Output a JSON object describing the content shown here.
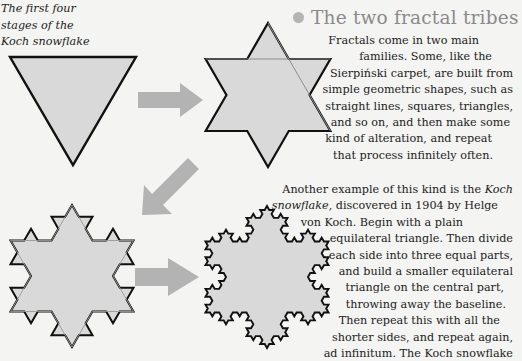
{
  "caption": {
    "lines": [
      "The first four",
      "stages of the",
      "Koch snowflake"
    ]
  },
  "heading": {
    "bullet_icon": "circle-bullet-icon",
    "title": "The two fractal tribes"
  },
  "paragraph1": {
    "lines": [
      "Fractals come in two main",
      "families. Some, like the",
      "Sierpiński carpet, are built from",
      "simple geometric shapes, such as",
      "straight lines, squares, triangles,",
      "and so on, and then make some",
      "kind of alteration, and repeat",
      "that process infinitely often."
    ]
  },
  "paragraph2": {
    "line1_pre": "Another example of this kind is the ",
    "line1_em": "Koch",
    "line2_em": "snowflake",
    "line2_post": ", discovered in 1904 by Helge",
    "lines": [
      "von Koch. Begin with a plain",
      "equilateral triangle. Then divide",
      "each side into three equal parts,",
      "and build a smaller equilateral",
      "triangle on the central part,",
      "throwing away the baseline.",
      "Then repeat this with all the",
      "shorter sides, and repeat again,",
      "ad infinitum. The Koch snowflake"
    ]
  },
  "figure": {
    "stages": [
      {
        "name": "stage-1",
        "label": "Stage 1: triangle"
      },
      {
        "name": "stage-2",
        "label": "Stage 2: star"
      },
      {
        "name": "stage-3",
        "label": "Stage 3"
      },
      {
        "name": "stage-4",
        "label": "Stage 4"
      }
    ],
    "colors": {
      "fill": "#d9d9d9",
      "stroke": "#111111",
      "arrow": "#b3b3b3",
      "bullet": "#b4b4b4",
      "heading": "#8a8a8a"
    }
  }
}
